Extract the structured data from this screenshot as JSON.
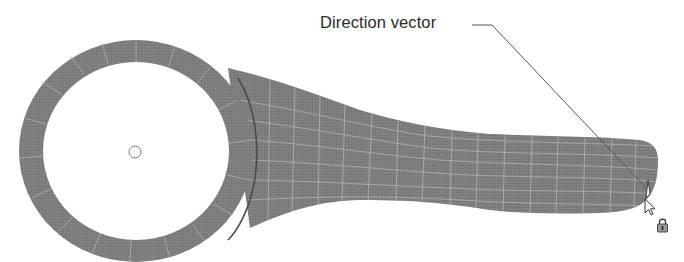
{
  "diagram": {
    "callout": {
      "label": "Direction vector"
    },
    "colors": {
      "mesh_fill": "#7b7b7b",
      "mesh_lines": "#b8b8b8",
      "edge_dark": "#4a4a4a",
      "leader": "#555555",
      "background": "#ffffff"
    },
    "icons": {
      "cursor": "arrow-pointer-icon",
      "lock": "lock-icon",
      "center_marker": "hole-center-marker"
    }
  }
}
